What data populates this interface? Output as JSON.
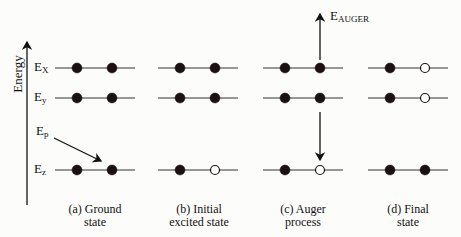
{
  "diagram": {
    "axis_label": "Energy",
    "levels": [
      {
        "name": "Ex",
        "main": "E",
        "sub": "X",
        "y": 68
      },
      {
        "name": "Ey",
        "main": "E",
        "sub": "y",
        "y": 98
      },
      {
        "name": "Ez",
        "main": "E",
        "sub": "z",
        "y": 170
      }
    ],
    "incident": {
      "main": "E",
      "sub": "p"
    },
    "auger": {
      "main": "E",
      "sub": "AUGER"
    },
    "panels": [
      {
        "id": "a",
        "label_line1": "(a)  Ground",
        "label_line2": "state",
        "x": 55,
        "occupancy": {
          "Ex": [
            1,
            1
          ],
          "Ey": [
            1,
            1
          ],
          "Ez": [
            1,
            1
          ]
        }
      },
      {
        "id": "b",
        "label_line1": "(b) Initial",
        "label_line2": "excited state",
        "x": 158,
        "occupancy": {
          "Ex": [
            1,
            1
          ],
          "Ey": [
            1,
            1
          ],
          "Ez": [
            1,
            0
          ]
        }
      },
      {
        "id": "c",
        "label_line1": "(c)  Auger",
        "label_line2": "process",
        "x": 263,
        "occupancy": {
          "Ex": [
            1,
            1
          ],
          "Ey": [
            1,
            1
          ],
          "Ez": [
            1,
            0
          ]
        }
      },
      {
        "id": "d",
        "label_line1": "(d) Final",
        "label_line2": "state",
        "x": 368,
        "occupancy": {
          "Ex": [
            1,
            0
          ],
          "Ey": [
            1,
            0
          ],
          "Ez": [
            1,
            1
          ]
        }
      }
    ],
    "colors": {
      "line": "#333333",
      "electron": "#1a1212",
      "hole_fill": "#ffffff"
    }
  }
}
